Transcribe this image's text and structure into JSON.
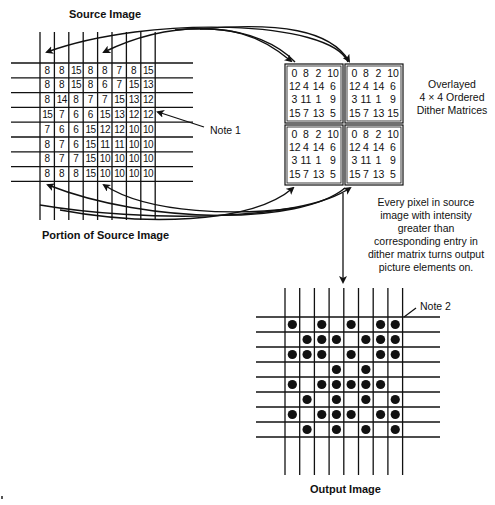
{
  "labels": {
    "source_image": "Source Image",
    "portion_of_source_image": "Portion of Source Image",
    "note1": "Note 1",
    "note2": "Note 2",
    "overlay_caption_line1": "Overlayed",
    "overlay_caption_line2": "4 × 4 Ordered",
    "overlay_caption_line3": "Dither Matrices",
    "rule_caption": [
      "Every pixel in source",
      "image with intensity",
      "greater than",
      "corresponding entry in",
      "dither matrix turns output",
      "picture elements on."
    ],
    "output_image": "Output Image"
  },
  "source_grid": {
    "rows": [
      [
        "8",
        "8",
        "15",
        "8",
        "8",
        "7",
        "8",
        "15"
      ],
      [
        "8",
        "8",
        "15",
        "8",
        "6",
        "7",
        "15",
        "13"
      ],
      [
        "8",
        "14",
        "8",
        "7",
        "7",
        "15",
        "13",
        "12"
      ],
      [
        "15",
        "7",
        "6",
        "6",
        "15",
        "13",
        "12",
        "12"
      ],
      [
        "7",
        "6",
        "6",
        "15",
        "12",
        "12",
        "10",
        "10"
      ],
      [
        "8",
        "7",
        "6",
        "15",
        "11",
        "11",
        "10",
        "10"
      ],
      [
        "8",
        "7",
        "7",
        "15",
        "10",
        "10",
        "10",
        "10"
      ],
      [
        "8",
        "8",
        "8",
        "15",
        "10",
        "10",
        "10",
        "10"
      ]
    ]
  },
  "dither_matrices": {
    "top_left": [
      [
        "0",
        "8",
        "2",
        "10"
      ],
      [
        "12",
        "4",
        "14",
        "6"
      ],
      [
        "3",
        "11",
        "1",
        "9"
      ],
      [
        "15",
        "7",
        "13",
        "5"
      ]
    ],
    "top_right": [
      [
        "0",
        "8",
        "2",
        "10"
      ],
      [
        "12",
        "4",
        "14",
        "6"
      ],
      [
        "3",
        "11",
        "1",
        "9"
      ],
      [
        "15",
        "7",
        "13",
        "15"
      ]
    ],
    "bottom_left": [
      [
        "0",
        "8",
        "2",
        "10"
      ],
      [
        "12",
        "4",
        "14",
        "6"
      ],
      [
        "3",
        "11",
        "1",
        "9"
      ],
      [
        "15",
        "7",
        "13",
        "5"
      ]
    ],
    "bottom_right": [
      [
        "0",
        "8",
        "2",
        "10"
      ],
      [
        "12",
        "4",
        "14",
        "6"
      ],
      [
        "3",
        "11",
        "1",
        "9"
      ],
      [
        "15",
        "7",
        "13",
        "5"
      ]
    ]
  },
  "output_grid": {
    "rows": [
      [
        1,
        0,
        1,
        0,
        1,
        0,
        1,
        1
      ],
      [
        0,
        1,
        1,
        1,
        0,
        1,
        1,
        1
      ],
      [
        1,
        1,
        1,
        0,
        1,
        0,
        1,
        1
      ],
      [
        0,
        0,
        0,
        1,
        0,
        1,
        0,
        0
      ],
      [
        1,
        0,
        1,
        1,
        1,
        1,
        1,
        0
      ],
      [
        0,
        1,
        0,
        1,
        0,
        1,
        0,
        1
      ],
      [
        1,
        0,
        1,
        1,
        1,
        0,
        1,
        1
      ],
      [
        0,
        1,
        0,
        1,
        0,
        1,
        0,
        1
      ]
    ]
  },
  "colors": {
    "ink": "#111111",
    "background": "#ffffff"
  }
}
